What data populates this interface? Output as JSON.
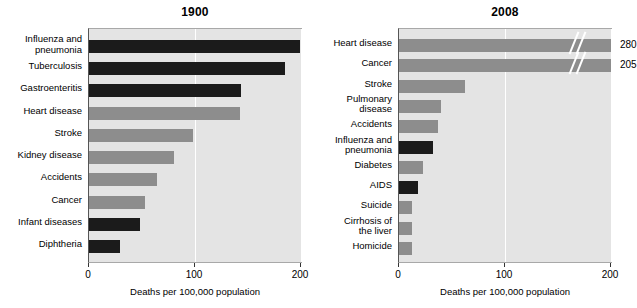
{
  "chart_data": [
    {
      "type": "bar",
      "title": "1900",
      "orientation": "horizontal",
      "xlabel": "Deaths per 100,000 population",
      "ylabel": "",
      "xlim": [
        0,
        200
      ],
      "xticks": [
        0,
        100,
        200
      ],
      "xticklabels": [
        "0",
        "100",
        "200"
      ],
      "grid": true,
      "legend": "none",
      "categories": [
        "Influenza and\npneumonia",
        "Tuberculosis",
        "Gastroenteritis",
        "Heart disease",
        "Stroke",
        "Kidney disease",
        "Accidents",
        "Cancer",
        "Infant diseases",
        "Diphtheria"
      ],
      "values": [
        199,
        185,
        143,
        142,
        98,
        80,
        64,
        53,
        48,
        29
      ],
      "bar_colors": [
        "dark",
        "dark",
        "dark",
        "gray",
        "gray",
        "gray",
        "gray",
        "gray",
        "dark",
        "dark"
      ],
      "value_labels": [
        "",
        "",
        "",
        "",
        "",
        "",
        "",
        "",
        "",
        ""
      ],
      "broken_axis": [
        false,
        false,
        false,
        false,
        false,
        false,
        false,
        false,
        false,
        false
      ]
    },
    {
      "type": "bar",
      "title": "2008",
      "orientation": "horizontal",
      "xlabel": "Deaths per 100,000 population",
      "ylabel": "",
      "xlim": [
        0,
        200
      ],
      "xticks": [
        0,
        100,
        200
      ],
      "xticklabels": [
        "0",
        "100",
        "200"
      ],
      "grid": true,
      "legend": "none",
      "categories": [
        "Heart disease",
        "Cancer",
        "Stroke",
        "Pulmonary\ndisease",
        "Accidents",
        "Influenza and\npneumonia",
        "Diabetes",
        "AIDS",
        "Suicide",
        "Cirrhosis of\nthe liver",
        "Homicide"
      ],
      "values": [
        280,
        205,
        62,
        40,
        37,
        32,
        23,
        18,
        12,
        12,
        12
      ],
      "bar_colors": [
        "gray",
        "gray",
        "gray",
        "gray",
        "gray",
        "dark",
        "gray",
        "dark",
        "gray",
        "gray",
        "gray"
      ],
      "value_labels": [
        "280",
        "205",
        "",
        "",
        "",
        "",
        "",
        "",
        "",
        "",
        ""
      ],
      "broken_axis": [
        true,
        true,
        false,
        false,
        false,
        false,
        false,
        false,
        false,
        false,
        false
      ]
    }
  ],
  "colors": {
    "bar_dark": "#1b1b1b",
    "bar_gray": "#8d8d8d",
    "plot_background": "#e4e4e4",
    "gridline": "#ffffff",
    "axis": "#333333",
    "text": "#000000"
  }
}
